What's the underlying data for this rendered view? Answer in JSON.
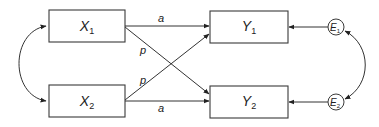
{
  "diagram": {
    "type": "path-model",
    "nodes": {
      "x1": {
        "var": "X",
        "sub": "1",
        "kind": "observed"
      },
      "x2": {
        "var": "X",
        "sub": "2",
        "kind": "observed"
      },
      "y1": {
        "var": "Y",
        "sub": "1",
        "kind": "observed"
      },
      "y2": {
        "var": "Y",
        "sub": "2",
        "kind": "observed"
      },
      "e1": {
        "var": "E",
        "sub": "1",
        "kind": "error"
      },
      "e2": {
        "var": "E",
        "sub": "2",
        "kind": "error"
      }
    },
    "edges": {
      "x1_y1": {
        "from": "X1",
        "to": "Y1",
        "label": "a"
      },
      "x2_y2": {
        "from": "X2",
        "to": "Y2",
        "label": "a"
      },
      "x1_y2": {
        "from": "X1",
        "to": "Y2",
        "label": "p"
      },
      "x2_y1": {
        "from": "X2",
        "to": "Y1",
        "label": "p"
      },
      "e1_y1": {
        "from": "E1",
        "to": "Y1",
        "label": ""
      },
      "e2_y2": {
        "from": "E2",
        "to": "Y2",
        "label": ""
      }
    },
    "covariances": [
      {
        "between": [
          "X1",
          "X2"
        ],
        "style": "double-headed curved arrow"
      },
      {
        "between": [
          "E1",
          "E2"
        ],
        "style": "double-headed curved arrow"
      }
    ],
    "colors": {
      "stroke": "#333333",
      "background": "#ffffff"
    }
  }
}
